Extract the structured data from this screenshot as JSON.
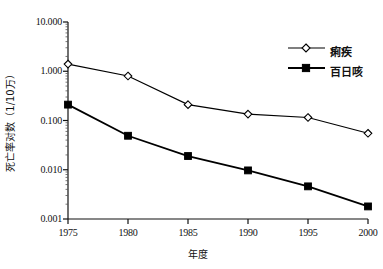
{
  "chart_data": {
    "type": "line",
    "title": "",
    "xlabel": "年度",
    "ylabel": "死亡率对数（1/10万）",
    "x": [
      1975,
      1980,
      1985,
      1990,
      1995,
      2000
    ],
    "xtick_labels": [
      "1975",
      "1980",
      "1985",
      "1990",
      "1995",
      "2000"
    ],
    "ytick_labels": [
      "10.000",
      "1.000",
      "0.100",
      "0.010",
      "0.001"
    ],
    "ytick_values": [
      10.0,
      1.0,
      0.1,
      0.01,
      0.001
    ],
    "yscale": "log",
    "ylim": [
      0.001,
      10.0
    ],
    "xlim": [
      1975,
      2000
    ],
    "grid": false,
    "legend_position": "top-right",
    "series": [
      {
        "name": "痢疾",
        "marker": "open-diamond",
        "color": "#000000",
        "values": [
          1.4,
          0.8,
          0.21,
          0.135,
          0.115,
          0.055
        ]
      },
      {
        "name": "百日咳",
        "marker": "filled-square",
        "color": "#000000",
        "values": [
          0.21,
          0.049,
          0.019,
          0.0097,
          0.0046,
          0.0018
        ]
      }
    ]
  },
  "axes": {
    "y_title": "死亡率对数（1/10万）",
    "x_title": "年度"
  },
  "legend": {
    "entries": [
      {
        "label": "痢疾"
      },
      {
        "label": "百日咳"
      }
    ]
  }
}
